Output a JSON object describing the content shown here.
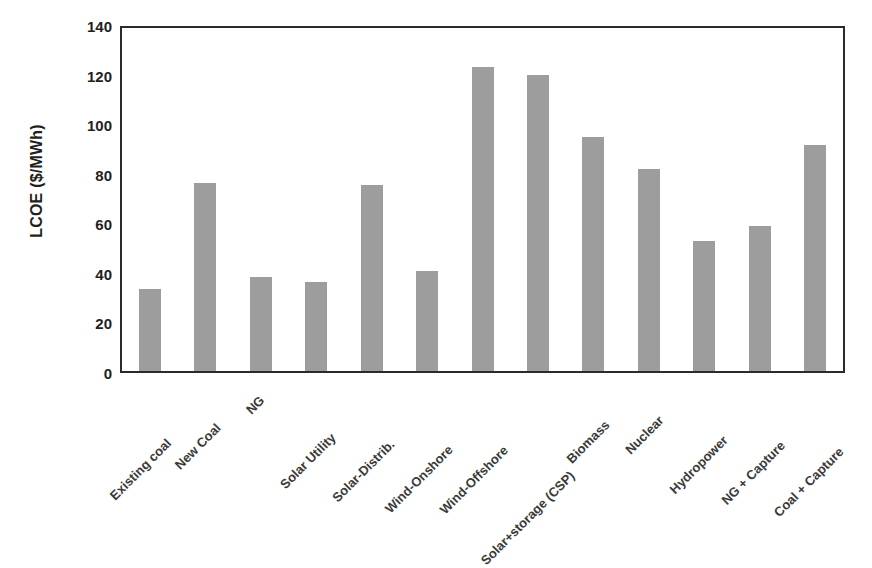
{
  "chart_data": {
    "type": "bar",
    "title": "",
    "xlabel": "",
    "ylabel": "LCOE ($/MWh)",
    "ylim": [
      0,
      140
    ],
    "ytick_step": 20,
    "yticks": [
      "140",
      "120",
      "100",
      "80",
      "60",
      "40",
      "20",
      "0"
    ],
    "grid": false,
    "legend": "none",
    "bar_color": "#9d9d9d",
    "axis_color": "#2b2b2b",
    "categories": [
      "Existing coal",
      "New Coal",
      "NG",
      "Solar Utility",
      "Solar-Distrib.",
      "Wind-Onshore",
      "Wind-Offshore",
      "Solar+storage (CSP)",
      "Biomass",
      "Nuclear",
      "Hydropower",
      "NG + Capture",
      "Coal + Capture"
    ],
    "values": [
      33,
      76,
      38,
      36,
      75,
      40.5,
      122.5,
      119.5,
      94.5,
      81.5,
      52.5,
      58.5,
      91
    ]
  }
}
